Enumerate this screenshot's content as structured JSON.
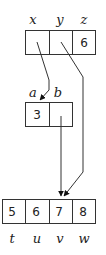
{
  "diagram": {
    "top_struct": {
      "labels": [
        "x",
        "y",
        "z"
      ],
      "values": [
        "",
        "",
        "6"
      ]
    },
    "mid_struct": {
      "labels": [
        "a",
        "b"
      ],
      "values": [
        "3",
        ""
      ]
    },
    "bottom_array": {
      "labels": [
        "t",
        "u",
        "v",
        "w"
      ],
      "values": [
        "5",
        "6",
        "7",
        "8"
      ]
    },
    "pointers": [
      {
        "from": "x",
        "to": "a"
      },
      {
        "from": "y",
        "to": "v"
      },
      {
        "from": "b",
        "to": "v"
      }
    ]
  }
}
